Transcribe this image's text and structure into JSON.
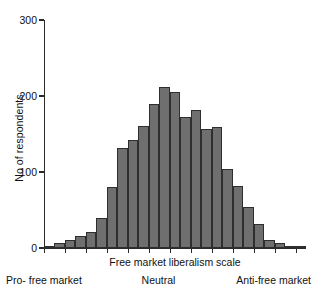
{
  "chart_data": {
    "type": "bar",
    "title": "",
    "subtitle": "",
    "xlabel": "Free market liberalism scale",
    "ylabel": "No of respondents",
    "ylim": [
      0,
      300
    ],
    "yticks": [
      0,
      100,
      200,
      300
    ],
    "ytick_labels": [
      "0",
      "100",
      "200",
      "300"
    ],
    "grid": false,
    "legend": null,
    "bar_color": "#6f6f6f",
    "bar_edge_color": "#2e2e2e",
    "axis_color": "#2b2b2b",
    "categories": [
      "1",
      "2",
      "3",
      "4",
      "5",
      "6",
      "7",
      "8",
      "9",
      "10",
      "11",
      "12",
      "13",
      "14",
      "15",
      "16",
      "17",
      "18",
      "19",
      "20",
      "21",
      "22",
      "23",
      "24",
      "25"
    ],
    "values": [
      3,
      7,
      11,
      16,
      21,
      40,
      80,
      131,
      142,
      160,
      189,
      212,
      205,
      173,
      181,
      157,
      159,
      104,
      81,
      54,
      31,
      10,
      7,
      2,
      1
    ],
    "annotations": [
      {
        "text": "Pro- free market",
        "position": "axis-left"
      },
      {
        "text": "Neutral",
        "position": "axis-center"
      },
      {
        "text": "Anti-free market",
        "position": "axis-right"
      }
    ]
  },
  "axis_captions": {
    "left": "Pro- free market",
    "center": "Neutral",
    "right": "Anti-free market"
  }
}
